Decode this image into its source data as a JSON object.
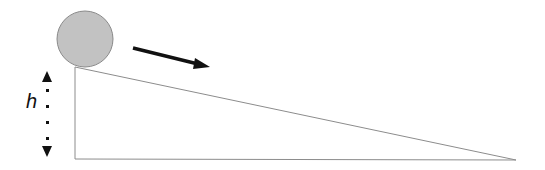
{
  "diagram": {
    "labels": {
      "height": "h"
    },
    "ball": {
      "cx": 85,
      "cy": 39,
      "r": 28,
      "fill": "#c2c2c2",
      "stroke": "#8a8a8a"
    },
    "ramp": {
      "vertices": [
        [
          75,
          67
        ],
        [
          75,
          159
        ],
        [
          516,
          160
        ]
      ],
      "stroke": "#8c8c8c"
    },
    "motion_arrow": {
      "from": [
        133,
        48
      ],
      "to": [
        210,
        67
      ],
      "color": "#111111"
    },
    "height_indicator": {
      "x": 47,
      "top": 73,
      "bottom": 157,
      "color": "#111111"
    }
  }
}
